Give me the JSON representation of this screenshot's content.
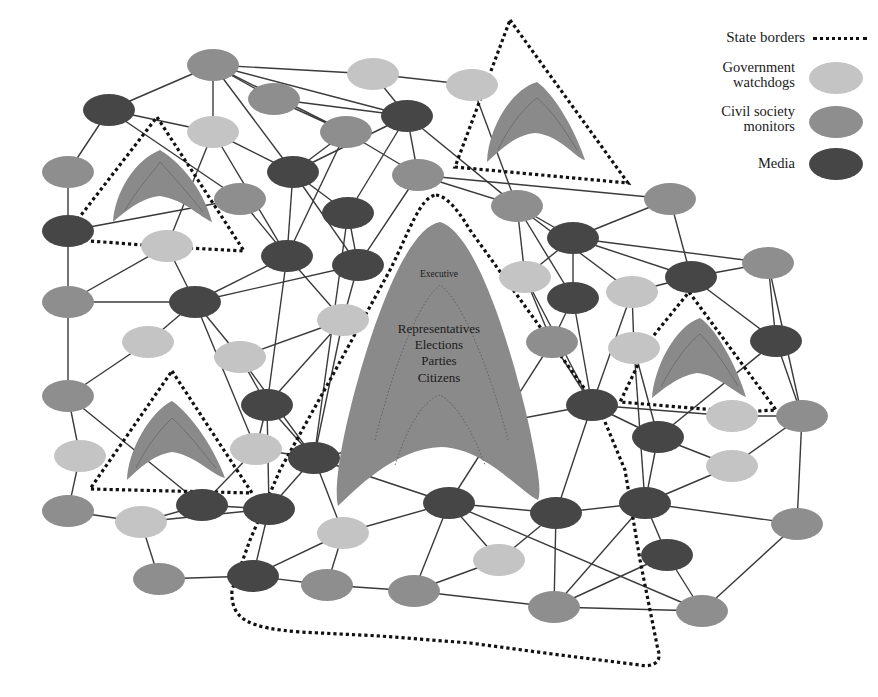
{
  "legend": {
    "title_state_borders": "State borders",
    "gov_watchdogs_line1": "Government",
    "gov_watchdogs_line2": "watchdogs",
    "civil_society_line1": "Civil society",
    "civil_society_line2": "monitors",
    "media": "Media",
    "colors": {
      "government_watchdogs": "#c4c4c4",
      "civil_society_monitors": "#8e8e8e",
      "media": "#464646",
      "state": "#8a8a8a"
    }
  },
  "central_state": {
    "top_label": "Executive",
    "labels": [
      "Representatives",
      "Elections",
      "Parties",
      "Citizens"
    ]
  },
  "nodes": [
    {
      "id": "a1",
      "type": "cs",
      "x": 213,
      "y": 65
    },
    {
      "id": "a2",
      "type": "gw",
      "x": 373,
      "y": 74
    },
    {
      "id": "a3",
      "type": "gw",
      "x": 472,
      "y": 85
    },
    {
      "id": "a4",
      "type": "md",
      "x": 109,
      "y": 110
    },
    {
      "id": "a5",
      "type": "cs",
      "x": 274,
      "y": 99
    },
    {
      "id": "a6",
      "type": "md",
      "x": 407,
      "y": 116
    },
    {
      "id": "a7",
      "type": "gw",
      "x": 213,
      "y": 132
    },
    {
      "id": "a8",
      "type": "cs",
      "x": 346,
      "y": 132
    },
    {
      "id": "a9",
      "type": "cs",
      "x": 68,
      "y": 172
    },
    {
      "id": "a10",
      "type": "md",
      "x": 293,
      "y": 172
    },
    {
      "id": "a11",
      "type": "cs",
      "x": 418,
      "y": 175
    },
    {
      "id": "a12",
      "type": "cs",
      "x": 240,
      "y": 199
    },
    {
      "id": "a13",
      "type": "md",
      "x": 348,
      "y": 213
    },
    {
      "id": "a14",
      "type": "cs",
      "x": 517,
      "y": 206
    },
    {
      "id": "a15",
      "type": "cs",
      "x": 670,
      "y": 199
    },
    {
      "id": "a16",
      "type": "md",
      "x": 68,
      "y": 231
    },
    {
      "id": "a17",
      "type": "gw",
      "x": 167,
      "y": 246
    },
    {
      "id": "a18",
      "type": "md",
      "x": 287,
      "y": 256
    },
    {
      "id": "a19",
      "type": "md",
      "x": 358,
      "y": 265
    },
    {
      "id": "a20",
      "type": "md",
      "x": 573,
      "y": 238
    },
    {
      "id": "a21",
      "type": "md",
      "x": 691,
      "y": 277
    },
    {
      "id": "a22",
      "type": "cs",
      "x": 768,
      "y": 263
    },
    {
      "id": "a23",
      "type": "gw",
      "x": 525,
      "y": 277
    },
    {
      "id": "a24",
      "type": "cs",
      "x": 68,
      "y": 302
    },
    {
      "id": "a25",
      "type": "md",
      "x": 195,
      "y": 302
    },
    {
      "id": "a26",
      "type": "gw",
      "x": 343,
      "y": 320
    },
    {
      "id": "a27",
      "type": "md",
      "x": 573,
      "y": 298
    },
    {
      "id": "a28",
      "type": "gw",
      "x": 632,
      "y": 292
    },
    {
      "id": "a29",
      "type": "gw",
      "x": 148,
      "y": 342
    },
    {
      "id": "a30",
      "type": "gw",
      "x": 240,
      "y": 357
    },
    {
      "id": "a31",
      "type": "cs",
      "x": 552,
      "y": 342
    },
    {
      "id": "a32",
      "type": "gw",
      "x": 634,
      "y": 348
    },
    {
      "id": "a33",
      "type": "md",
      "x": 776,
      "y": 341
    },
    {
      "id": "a34",
      "type": "cs",
      "x": 68,
      "y": 396
    },
    {
      "id": "a35",
      "type": "md",
      "x": 267,
      "y": 405
    },
    {
      "id": "a36",
      "type": "md",
      "x": 592,
      "y": 405
    },
    {
      "id": "a37",
      "type": "gw",
      "x": 732,
      "y": 416
    },
    {
      "id": "a38",
      "type": "cs",
      "x": 802,
      "y": 416
    },
    {
      "id": "a39",
      "type": "gw",
      "x": 80,
      "y": 456
    },
    {
      "id": "a40",
      "type": "gw",
      "x": 256,
      "y": 449
    },
    {
      "id": "a41",
      "type": "md",
      "x": 314,
      "y": 458
    },
    {
      "id": "a42",
      "type": "md",
      "x": 658,
      "y": 437
    },
    {
      "id": "a43",
      "type": "gw",
      "x": 732,
      "y": 466
    },
    {
      "id": "a44",
      "type": "md",
      "x": 202,
      "y": 505
    },
    {
      "id": "a45",
      "type": "md",
      "x": 269,
      "y": 509
    },
    {
      "id": "a46",
      "type": "md",
      "x": 449,
      "y": 503
    },
    {
      "id": "a47",
      "type": "md",
      "x": 556,
      "y": 513
    },
    {
      "id": "a48",
      "type": "md",
      "x": 645,
      "y": 503
    },
    {
      "id": "a49",
      "type": "cs",
      "x": 68,
      "y": 511
    },
    {
      "id": "a50",
      "type": "gw",
      "x": 141,
      "y": 522
    },
    {
      "id": "a51",
      "type": "gw",
      "x": 343,
      "y": 533
    },
    {
      "id": "a52",
      "type": "cs",
      "x": 797,
      "y": 524
    },
    {
      "id": "a53",
      "type": "gw",
      "x": 499,
      "y": 560
    },
    {
      "id": "a54",
      "type": "md",
      "x": 667,
      "y": 555
    },
    {
      "id": "a55",
      "type": "cs",
      "x": 159,
      "y": 579
    },
    {
      "id": "a56",
      "type": "md",
      "x": 253,
      "y": 576
    },
    {
      "id": "a57",
      "type": "cs",
      "x": 327,
      "y": 585
    },
    {
      "id": "a58",
      "type": "cs",
      "x": 414,
      "y": 591
    },
    {
      "id": "a59",
      "type": "cs",
      "x": 554,
      "y": 607
    },
    {
      "id": "a60",
      "type": "cs",
      "x": 702,
      "y": 611
    }
  ],
  "edges": [
    [
      "a1",
      "a4"
    ],
    [
      "a1",
      "a5"
    ],
    [
      "a1",
      "a2"
    ],
    [
      "a1",
      "a10"
    ],
    [
      "a1",
      "a8"
    ],
    [
      "a1",
      "a6"
    ],
    [
      "a1",
      "a7"
    ],
    [
      "a2",
      "a3"
    ],
    [
      "a2",
      "a6"
    ],
    [
      "a3",
      "a14"
    ],
    [
      "a4",
      "a9"
    ],
    [
      "a4",
      "a7"
    ],
    [
      "a4",
      "a12"
    ],
    [
      "a5",
      "a8"
    ],
    [
      "a5",
      "a6"
    ],
    [
      "a6",
      "a13"
    ],
    [
      "a6",
      "a10"
    ],
    [
      "a6",
      "a11"
    ],
    [
      "a6",
      "a14"
    ],
    [
      "a7",
      "a10"
    ],
    [
      "a7",
      "a17"
    ],
    [
      "a7",
      "a18"
    ],
    [
      "a8",
      "a11"
    ],
    [
      "a8",
      "a18"
    ],
    [
      "a8",
      "a10"
    ],
    [
      "a9",
      "a16"
    ],
    [
      "a10",
      "a13"
    ],
    [
      "a10",
      "a18"
    ],
    [
      "a10",
      "a19"
    ],
    [
      "a11",
      "a14"
    ],
    [
      "a11",
      "a19"
    ],
    [
      "a12",
      "a18"
    ],
    [
      "a12",
      "a16"
    ],
    [
      "a13",
      "a19"
    ],
    [
      "a13",
      "a41"
    ],
    [
      "a14",
      "a20"
    ],
    [
      "a14",
      "a23"
    ],
    [
      "a14",
      "a28"
    ],
    [
      "a14",
      "a27"
    ],
    [
      "a15",
      "a20"
    ],
    [
      "a15",
      "a21"
    ],
    [
      "a15",
      "a11"
    ],
    [
      "a16",
      "a24"
    ],
    [
      "a17",
      "a24"
    ],
    [
      "a17",
      "a25"
    ],
    [
      "a18",
      "a25"
    ],
    [
      "a18",
      "a35"
    ],
    [
      "a18",
      "a26"
    ],
    [
      "a19",
      "a25"
    ],
    [
      "a19",
      "a26"
    ],
    [
      "a20",
      "a22"
    ],
    [
      "a20",
      "a21"
    ],
    [
      "a20",
      "a27"
    ],
    [
      "a20",
      "a23"
    ],
    [
      "a21",
      "a22"
    ],
    [
      "a21",
      "a28"
    ],
    [
      "a21",
      "a33"
    ],
    [
      "a22",
      "a33"
    ],
    [
      "a22",
      "a38"
    ],
    [
      "a23",
      "a31"
    ],
    [
      "a23",
      "a36"
    ],
    [
      "a24",
      "a25"
    ],
    [
      "a24",
      "a34"
    ],
    [
      "a25",
      "a30"
    ],
    [
      "a25",
      "a29"
    ],
    [
      "a25",
      "a40"
    ],
    [
      "a26",
      "a30"
    ],
    [
      "a26",
      "a35"
    ],
    [
      "a26",
      "a41"
    ],
    [
      "a27",
      "a31"
    ],
    [
      "a27",
      "a36"
    ],
    [
      "a28",
      "a36"
    ],
    [
      "a28",
      "a32"
    ],
    [
      "a29",
      "a34"
    ],
    [
      "a30",
      "a35"
    ],
    [
      "a30",
      "a41"
    ],
    [
      "a31",
      "a36"
    ],
    [
      "a31",
      "a46"
    ],
    [
      "a32",
      "a42"
    ],
    [
      "a32",
      "a48"
    ],
    [
      "a33",
      "a42"
    ],
    [
      "a33",
      "a38"
    ],
    [
      "a34",
      "a39"
    ],
    [
      "a34",
      "a44"
    ],
    [
      "a35",
      "a40"
    ],
    [
      "a35",
      "a41"
    ],
    [
      "a35",
      "a45"
    ],
    [
      "a36",
      "a37"
    ],
    [
      "a36",
      "a42"
    ],
    [
      "a36",
      "a47"
    ],
    [
      "a36",
      "a41"
    ],
    [
      "a37",
      "a38"
    ],
    [
      "a38",
      "a43"
    ],
    [
      "a38",
      "a52"
    ],
    [
      "a39",
      "a49"
    ],
    [
      "a40",
      "a41"
    ],
    [
      "a40",
      "a44"
    ],
    [
      "a41",
      "a45"
    ],
    [
      "a41",
      "a51"
    ],
    [
      "a41",
      "a46"
    ],
    [
      "a42",
      "a43"
    ],
    [
      "a42",
      "a48"
    ],
    [
      "a43",
      "a48"
    ],
    [
      "a44",
      "a45"
    ],
    [
      "a44",
      "a50"
    ],
    [
      "a45",
      "a56"
    ],
    [
      "a45",
      "a50"
    ],
    [
      "a46",
      "a47"
    ],
    [
      "a46",
      "a51"
    ],
    [
      "a46",
      "a58"
    ],
    [
      "a46",
      "a60"
    ],
    [
      "a46",
      "a53"
    ],
    [
      "a47",
      "a53"
    ],
    [
      "a47",
      "a48"
    ],
    [
      "a47",
      "a59"
    ],
    [
      "a48",
      "a52"
    ],
    [
      "a48",
      "a54"
    ],
    [
      "a48",
      "a59"
    ],
    [
      "a49",
      "a50"
    ],
    [
      "a50",
      "a55"
    ],
    [
      "a51",
      "a57"
    ],
    [
      "a51",
      "a56"
    ],
    [
      "a52",
      "a60"
    ],
    [
      "a53",
      "a58"
    ],
    [
      "a54",
      "a60"
    ],
    [
      "a54",
      "a59"
    ],
    [
      "a55",
      "a56"
    ],
    [
      "a56",
      "a57"
    ],
    [
      "a57",
      "a58"
    ],
    [
      "a58",
      "a59"
    ],
    [
      "a59",
      "a60"
    ]
  ]
}
